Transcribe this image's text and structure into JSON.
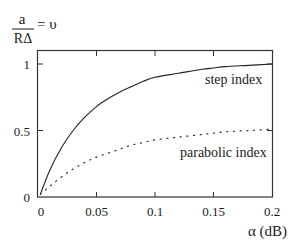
{
  "chart_data": {
    "type": "line",
    "title": "",
    "ylabel": {
      "numerator": "a",
      "denominator": "RΔ",
      "suffix": "= υ"
    },
    "xlabel": "α (dB)",
    "xlim": [
      0,
      0.2
    ],
    "ylim": [
      0,
      1.1
    ],
    "x_ticks": [
      0,
      0.05,
      0.1,
      0.15,
      0.2
    ],
    "x_tick_labels": [
      "0",
      "0.05",
      "0.1",
      "0.15",
      "0.2"
    ],
    "y_ticks": [
      0,
      0.5,
      1
    ],
    "y_tick_labels": [
      "0",
      "0.5",
      "1"
    ],
    "grid": false,
    "legend": "inline labels",
    "x": [
      0.002,
      0.01,
      0.02,
      0.03,
      0.04,
      0.05,
      0.06,
      0.07,
      0.08,
      0.09,
      0.1,
      0.12,
      0.14,
      0.15,
      0.16,
      0.18,
      0.2
    ],
    "series": [
      {
        "name": "step index",
        "style": "solid",
        "values": [
          0.02,
          0.2,
          0.37,
          0.5,
          0.6,
          0.68,
          0.74,
          0.79,
          0.83,
          0.87,
          0.9,
          0.93,
          0.96,
          0.97,
          0.98,
          0.99,
          1.0
        ]
      },
      {
        "name": "parabolic index",
        "style": "dotted",
        "values": [
          0.02,
          0.08,
          0.15,
          0.21,
          0.26,
          0.3,
          0.33,
          0.36,
          0.39,
          0.41,
          0.43,
          0.45,
          0.47,
          0.48,
          0.49,
          0.5,
          0.51
        ]
      }
    ]
  },
  "labels": {
    "series_step": "step index",
    "series_parabolic": "parabolic index"
  }
}
